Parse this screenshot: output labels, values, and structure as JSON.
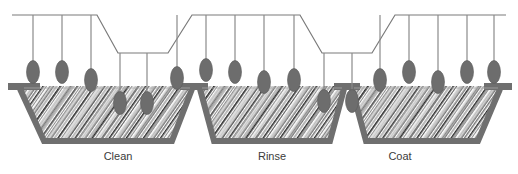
{
  "diagram": {
    "caption": "",
    "canvas": {
      "width": 518,
      "height": 174,
      "background": "#ffffff"
    },
    "colors": {
      "rail_line": "#7a7a7a",
      "hanger_rod": "#8a8a8a",
      "part_fill": "#6d6d6d",
      "part_stroke": "#5a5a5a",
      "tank_wall": "#6f6f6f",
      "tank_wall_shadow": "#8c8c8c",
      "liquid_background": "#ffffff",
      "liquid_hatch_dark": "#2f2f2f",
      "liquid_hatch_mid": "#7d7d7d",
      "liquid_hatch_light": "#b9b9b9",
      "label_text": "#3b3b3b",
      "liquid_surface": "#9a9a9a"
    },
    "geometry": {
      "rail_top_y": 15,
      "rail_dip_y": 53,
      "rail_stroke_width": 1.2,
      "tank_rim_y": 86,
      "tank_bottom_y": 141,
      "tank_wall_thickness": 6,
      "part_rx": 6.5,
      "part_ry": 11.5
    }
  },
  "conveyor": {
    "name": "overhead-conveyor-rail",
    "path_points": [
      [
        12,
        15
      ],
      [
        97,
        15
      ],
      [
        118,
        53
      ],
      [
        168,
        53
      ],
      [
        192,
        15
      ],
      [
        300,
        15
      ],
      [
        322,
        53
      ],
      [
        372,
        53
      ],
      [
        395,
        15
      ],
      [
        506,
        15
      ]
    ],
    "stub_left": {
      "x1": 12,
      "y1": 15,
      "x2": 12,
      "y2": 15
    },
    "stub_right": {
      "x1": 506,
      "y1": 15,
      "x2": 506,
      "y2": 15
    }
  },
  "tanks": [
    {
      "id": "tank-clean",
      "label": "Clean",
      "label_x": 118,
      "label_y": 160,
      "rim_left": 20,
      "rim_right": 192,
      "bottom_left": 44,
      "bottom_right": 172,
      "liquid": "cleaning solution"
    },
    {
      "id": "tank-rinse",
      "label": "Rinse",
      "label_x": 272,
      "label_y": 160,
      "rim_left": 200,
      "rim_right": 344,
      "bottom_left": 214,
      "bottom_right": 330,
      "liquid": "rinse water"
    },
    {
      "id": "tank-coat",
      "label": "Coat",
      "label_x": 400,
      "label_y": 160,
      "rim_left": 352,
      "rim_right": 500,
      "bottom_left": 366,
      "bottom_right": 478,
      "liquid": "coating bath"
    }
  ],
  "hangers": [
    {
      "id": "hanger-1",
      "rail_x": 33,
      "rail_y": 15,
      "part_cy": 72,
      "submerged": false
    },
    {
      "id": "hanger-2",
      "rail_x": 62,
      "rail_y": 15,
      "part_cy": 72,
      "submerged": false
    },
    {
      "id": "hanger-3",
      "rail_x": 91,
      "rail_y": 15,
      "part_cy": 80,
      "submerged": false
    },
    {
      "id": "hanger-4",
      "rail_x": 120,
      "rail_y": 53,
      "part_cy": 103,
      "submerged": true
    },
    {
      "id": "hanger-5",
      "rail_x": 147,
      "rail_y": 53,
      "part_cy": 103,
      "submerged": true
    },
    {
      "id": "hanger-6",
      "rail_x": 177,
      "rail_y": 15,
      "part_cy": 78,
      "submerged": false
    },
    {
      "id": "hanger-7",
      "rail_x": 206,
      "rail_y": 15,
      "part_cy": 70,
      "submerged": false
    },
    {
      "id": "hanger-8",
      "rail_x": 235,
      "rail_y": 15,
      "part_cy": 72,
      "submerged": false
    },
    {
      "id": "hanger-9",
      "rail_x": 264,
      "rail_y": 15,
      "part_cy": 82,
      "submerged": false
    },
    {
      "id": "hanger-10",
      "rail_x": 294,
      "rail_y": 15,
      "part_cy": 80,
      "submerged": false
    },
    {
      "id": "hanger-11",
      "rail_x": 324,
      "rail_y": 53,
      "part_cy": 101,
      "submerged": true
    },
    {
      "id": "hanger-12",
      "rail_x": 352,
      "rail_y": 53,
      "part_cy": 101,
      "submerged": true
    },
    {
      "id": "hanger-13",
      "rail_x": 380,
      "rail_y": 15,
      "part_cy": 80,
      "submerged": false
    },
    {
      "id": "hanger-14",
      "rail_x": 409,
      "rail_y": 15,
      "part_cy": 72,
      "submerged": false
    },
    {
      "id": "hanger-15",
      "rail_x": 438,
      "rail_y": 15,
      "part_cy": 82,
      "submerged": true
    },
    {
      "id": "hanger-16",
      "rail_x": 467,
      "rail_y": 15,
      "part_cy": 72,
      "submerged": false
    },
    {
      "id": "hanger-17",
      "rail_x": 494,
      "rail_y": 15,
      "part_cy": 72,
      "submerged": false
    }
  ]
}
